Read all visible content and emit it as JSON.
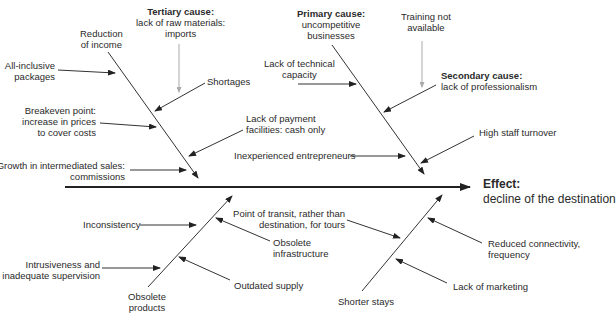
{
  "effect": {
    "title": "Effect:",
    "text": "decline of the destination"
  },
  "upper_left_bone": {
    "head": [
      "Reduction",
      "of income"
    ],
    "tertiary_title": "Tertiary cause:",
    "tertiary_text": [
      "lack of raw materials:",
      "imports"
    ],
    "causes": {
      "all_inclusive": [
        "All-inclusive",
        "packages"
      ],
      "shortages": "Shortages",
      "breakeven": [
        "Breakeven point:",
        "increase in prices",
        "to cover costs"
      ],
      "payment": [
        "Lack of payment",
        "facilities: cash only"
      ],
      "growth": [
        "Growth in intermediated sales:",
        "commissions"
      ]
    }
  },
  "upper_right_bone": {
    "primary_title": "Primary cause:",
    "primary_text": [
      "uncompetitive",
      "businesses"
    ],
    "training": [
      "Training not",
      "available"
    ],
    "secondary_title": "Secondary cause:",
    "secondary_text": "lack of professionalism",
    "causes": {
      "technical": [
        "Lack of technical",
        "capacity"
      ],
      "inexperienced": "Inexperienced entrepreneurs",
      "turnover": "High staff turnover"
    }
  },
  "lower_left_bone": {
    "tail": [
      "Obsolete",
      "products"
    ],
    "causes": {
      "inconsistency": "Inconsistency",
      "intrusiveness": [
        "Intrusiveness and",
        "inadequate supervision"
      ],
      "infrastructure": [
        "Obsolete",
        "infrastructure"
      ],
      "outdated": "Outdated supply"
    }
  },
  "lower_right_bone": {
    "tail": "Shorter stays",
    "causes": {
      "transit": [
        "Point of transit, rather than",
        "destination, for tours"
      ],
      "connectivity": [
        "Reduced connectivity,",
        "frequency"
      ],
      "marketing": "Lack of marketing"
    }
  }
}
